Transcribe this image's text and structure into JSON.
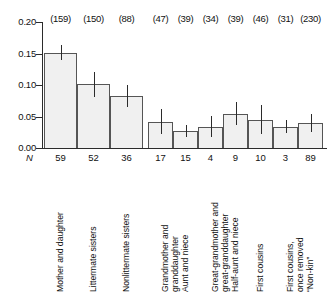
{
  "chart_data": {
    "type": "bar",
    "title": "",
    "subtitle": "",
    "xlabel": "",
    "ylabel": "",
    "ylim": [
      0.0,
      0.2
    ],
    "grid": false,
    "legend": null,
    "y_ticks": [
      "0.20",
      "0.15",
      "0.10",
      "0.05",
      "0.00"
    ],
    "y_tick_values": [
      0.2,
      0.15,
      0.1,
      0.05,
      0.0
    ],
    "n_row_title": "N",
    "categories": [
      "Mother and daughter",
      "Littermate sisters",
      "Nonlittermate sisters",
      "Grandmother and\ngranddaughter",
      "Aunt and niece",
      "Great-grandmother and\ngreat-granddaughter",
      "Half-aunt and niece",
      "First cousins",
      "First cousins,\nonce removed",
      "“Non-kin”"
    ],
    "values": [
      0.151,
      0.102,
      0.083,
      0.042,
      0.027,
      0.034,
      0.054,
      0.044,
      0.034,
      0.04
    ],
    "error_low": [
      0.139,
      0.081,
      0.065,
      0.022,
      0.018,
      0.017,
      0.036,
      0.022,
      0.024,
      0.026
    ],
    "error_high": [
      0.163,
      0.121,
      0.1,
      0.062,
      0.037,
      0.051,
      0.073,
      0.068,
      0.045,
      0.054
    ],
    "counts": [
      "(159)",
      "(150)",
      "(88)",
      "(47)",
      "(39)",
      "(34)",
      "(39)",
      "(46)",
      "(31)",
      "(230)"
    ],
    "n_values": [
      "59",
      "52",
      "36",
      "17",
      "15",
      "4",
      "9",
      "10",
      "3",
      "89"
    ],
    "colors": {
      "bar_fill": "#f0f0f0",
      "bar_border": "#555555",
      "axis": "#2b2b2b",
      "text": "#111111",
      "background": "#ffffff"
    }
  }
}
